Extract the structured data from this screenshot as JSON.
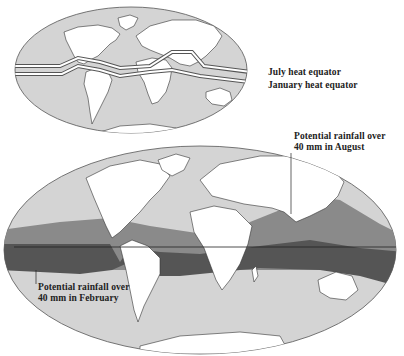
{
  "top_map": {
    "legend": {
      "july": "July heat equator",
      "january": "January heat equator"
    }
  },
  "bottom_map": {
    "labels": {
      "august_line1": "Potential rainfall over",
      "august_line2": "40 mm in August",
      "february_line1": "Potential rainfall over",
      "february_line2": "40 mm in February"
    }
  },
  "colors": {
    "ocean": "#d4d4d4",
    "land": "#ffffff",
    "august_band": "#8a8a8a",
    "february_band": "#555555",
    "outline": "#333333"
  }
}
